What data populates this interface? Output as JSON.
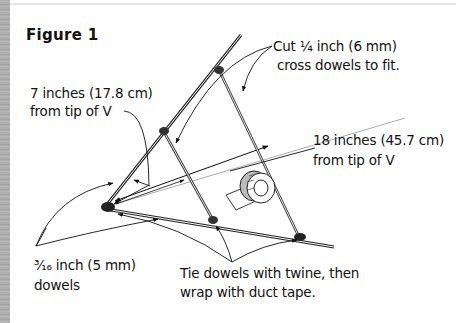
{
  "figure": {
    "title": "Figure 1",
    "labels": {
      "cross_dowels_line1": "Cut ¼ inch (6 mm)",
      "cross_dowels_line2": "cross dowels to fit.",
      "seven_inch_line1": "7 inches (17.8 cm)",
      "seven_inch_line2": "from tip of V",
      "eighteen_inch_line1": "18 inches (45.7 cm)",
      "eighteen_inch_line2": "from tip of V",
      "dowels_line1": "³⁄₁₆ inch (5 mm)",
      "dowels_line2": "dowels",
      "tie_line1": "Tie dowels with twine, then",
      "tie_line2": "wrap with duct tape."
    },
    "elements": {
      "v_frame": "two dowels forming a V",
      "cross_dowels": 2,
      "joints": 5,
      "duct_tape_roll": "duct-tape-roll-icon"
    },
    "colors": {
      "ink": "#111111",
      "background": "#ffffff",
      "left_strip": "#a9a9a9"
    }
  }
}
